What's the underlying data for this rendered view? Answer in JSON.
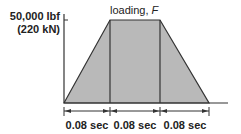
{
  "diagram": {
    "title": "loading, F",
    "title_text": "loading, ",
    "title_var": "F",
    "y_label_line1": "50,000 lbf",
    "y_label_line2": "(220 kN)",
    "intervals": [
      {
        "label": "0.08 sec"
      },
      {
        "label": "0.08 sec"
      },
      {
        "label": "0.08 sec"
      }
    ],
    "fill_color": "#b9b9b9",
    "line_color": "#333333"
  }
}
